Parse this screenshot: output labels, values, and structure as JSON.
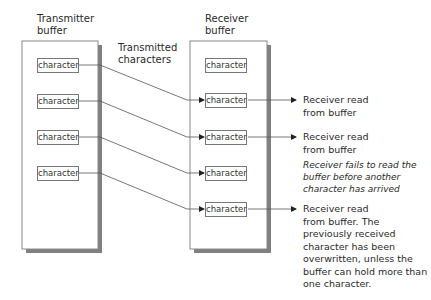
{
  "transmitter": {
    "title_line1": "Transmitter",
    "title_line2": "buffer",
    "cells": [
      "character",
      "character",
      "character",
      "character"
    ]
  },
  "receiver": {
    "title_line1": "Receiver",
    "title_line2": "buffer",
    "cells": [
      "character",
      "character",
      "character",
      "character",
      "character"
    ]
  },
  "link_label": {
    "line1": "Transmitted",
    "line2": "characters"
  },
  "outcomes": [
    {
      "lines": [
        "Receiver read",
        "from buffer"
      ]
    },
    {
      "lines": [
        "Receiver read",
        "from buffer"
      ],
      "note": [
        "Receiver fails to read the",
        "buffer before another",
        "character has arrived"
      ]
    },
    {
      "lines": [
        "Receiver read",
        "from buffer. The",
        "previously received",
        "character has been",
        "overwritten, unless the",
        "buffer can hold more than",
        "one character."
      ]
    }
  ],
  "colors": {
    "box_border": "#777777",
    "shadow": "#7a7a7a",
    "line": "#444444"
  }
}
